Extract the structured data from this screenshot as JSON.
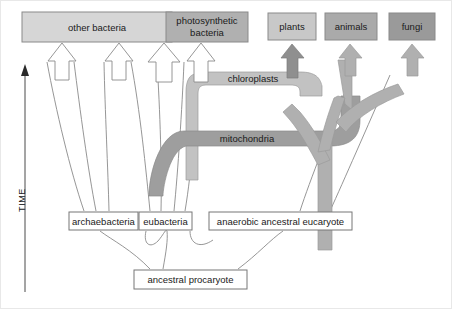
{
  "figure": {
    "type": "phylogenetic-endosymbiosis-diagram",
    "background": "#ffffff",
    "frame_color": "#e8e8e8"
  },
  "axis": {
    "label": "TIME",
    "direction": "upward",
    "color": "#4a4a4a"
  },
  "colors": {
    "box_light": "#d6d6d6",
    "box_mid": "#b8b8b8",
    "box_dark": "#9a9a9a",
    "box_white": "#ffffff",
    "box_border_gray": "#8a8a8a",
    "box_border_thin": "#777777",
    "band_light": "#c2c2c2",
    "band_dark": "#9e9e9e",
    "band_mid": "#b0b0b0",
    "arrow_dark": "#8f8f8f",
    "line": "#8a8a8a",
    "text": "#1a1a1a"
  },
  "top_boxes": [
    {
      "id": "other-bacteria",
      "label": "other bacteria",
      "fill": "#d6d6d6",
      "x": 22,
      "y": 12,
      "w": 150,
      "h": 30
    },
    {
      "id": "photosynthetic-bacteria",
      "label_line1": "photosynthetic",
      "label_line2": "bacteria",
      "fill": "#b0b0b0",
      "x": 166,
      "y": 12,
      "w": 82,
      "h": 30
    },
    {
      "id": "plants",
      "label": "plants",
      "fill": "#c8c8c8",
      "x": 268,
      "y": 13,
      "w": 48,
      "h": 27
    },
    {
      "id": "animals",
      "label": "animals",
      "fill": "#aaaaaa",
      "x": 325,
      "y": 13,
      "w": 52,
      "h": 27
    },
    {
      "id": "fungi",
      "label": "fungi",
      "fill": "#9a9a9a",
      "x": 389,
      "y": 13,
      "w": 46,
      "h": 27
    }
  ],
  "mid_boxes": [
    {
      "id": "archaebacteria",
      "label": "archaebacteria",
      "fill": "#ffffff",
      "x": 69,
      "y": 212,
      "w": 69,
      "h": 18
    },
    {
      "id": "eubacteria",
      "label": "eubacteria",
      "fill": "#ffffff",
      "x": 139,
      "y": 212,
      "w": 53,
      "h": 18
    },
    {
      "id": "anaerobic-ancestral-eucaryote",
      "label": "anaerobic ancestral eucaryote",
      "fill": "#ffffff",
      "x": 209,
      "y": 212,
      "w": 143,
      "h": 18
    }
  ],
  "bottom_boxes": [
    {
      "id": "ancestral-procaryote",
      "label": "ancestral procaryote",
      "fill": "#ffffff",
      "x": 134,
      "y": 270,
      "w": 113,
      "h": 19
    }
  ],
  "bands": [
    {
      "id": "chloroplasts",
      "label": "chloroplasts",
      "fill": "#c2c2c2",
      "label_x": 253,
      "label_y": 83
    },
    {
      "id": "mitochondria",
      "label": "mitochondria",
      "fill": "#9e9e9e",
      "label_x": 247,
      "label_y": 155
    }
  ],
  "arrows": {
    "other_bacteria_hollow_count": 3,
    "photosynthetic_hollow_count": 1,
    "filled_targets": [
      "plants",
      "animals",
      "fungi"
    ]
  }
}
